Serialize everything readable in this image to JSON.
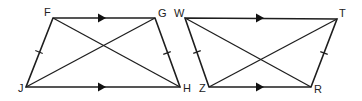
{
  "figures": [
    {
      "name": "trapezoid-FGHJ",
      "vertices": {
        "F": {
          "label": "F",
          "x": 53,
          "y": 18,
          "lx": 44,
          "ly": 16
        },
        "G": {
          "label": "G",
          "x": 155,
          "y": 18,
          "lx": 158,
          "ly": 17
        },
        "H": {
          "label": "H",
          "x": 180,
          "y": 87,
          "lx": 183,
          "ly": 92
        },
        "J": {
          "label": "J",
          "x": 26,
          "y": 87,
          "lx": 18,
          "ly": 92
        }
      },
      "parallel_arrows": [
        {
          "side": "FG",
          "tip_x": 106,
          "y": 18
        },
        {
          "side": "JH",
          "tip_x": 106,
          "y": 87
        }
      ],
      "congruence_ticks": [
        {
          "side": "FJ",
          "x": 39,
          "y": 52
        },
        {
          "side": "GH",
          "x": 167,
          "y": 53
        }
      ],
      "diagonals": [
        "FH",
        "GJ"
      ]
    },
    {
      "name": "trapezoid-WTRZ",
      "vertices": {
        "W": {
          "label": "W",
          "x": 185,
          "y": 18,
          "lx": 174,
          "ly": 17
        },
        "T": {
          "label": "T",
          "x": 337,
          "y": 19,
          "lx": 339,
          "ly": 17
        },
        "R": {
          "label": "R",
          "x": 311,
          "y": 87,
          "lx": 314,
          "ly": 93
        },
        "Z": {
          "label": "Z",
          "x": 209,
          "y": 87,
          "lx": 199,
          "ly": 92
        }
      },
      "parallel_arrows": [
        {
          "side": "WT",
          "tip_x": 264,
          "y": 18
        },
        {
          "side": "ZR",
          "tip_x": 264,
          "y": 87
        }
      ],
      "congruence_ticks": [
        {
          "side": "WZ",
          "x": 197,
          "y": 52
        },
        {
          "side": "TR",
          "x": 324,
          "y": 53
        }
      ],
      "diagonals": [
        "WR",
        "TZ"
      ]
    }
  ],
  "colors": {
    "stroke": "#1e1e1e",
    "background": "#ffffff"
  }
}
